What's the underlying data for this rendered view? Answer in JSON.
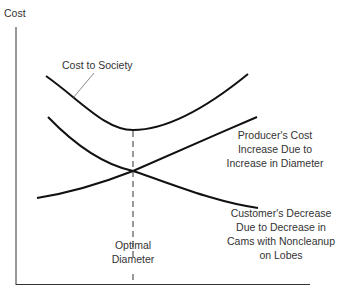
{
  "diagram": {
    "y_axis_label": "Cost",
    "curves": [
      {
        "name": "Cost to Society",
        "label": "Cost to Society"
      },
      {
        "name": "Producer's Cost",
        "label_lines": [
          "Producer's Cost",
          "Increase Due to",
          "Increase in Diameter"
        ]
      },
      {
        "name": "Customer's Decrease",
        "label_lines": [
          "Customer's Decrease",
          "Due to Decrease in",
          "Cams with Noncleanup",
          "on Lobes"
        ]
      }
    ],
    "optimal_label_lines": [
      "Optimal",
      "Diameter"
    ]
  }
}
